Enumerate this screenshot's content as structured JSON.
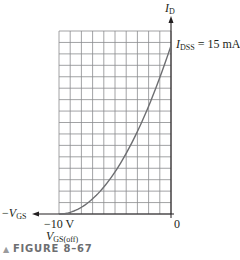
{
  "figure": {
    "caption_marker": "▲",
    "caption": "FIGURE 8–67"
  },
  "labels": {
    "y_axis_var": "I",
    "y_axis_sub": "D",
    "idss_var": "I",
    "idss_sub": "DSS",
    "idss_value": " = 15 mA",
    "x_axis_prefix": "−",
    "x_axis_var": "V",
    "x_axis_sub": "GS",
    "x_min_tick": "−10 V",
    "x_zero_tick": "0",
    "vgs_off_var": "V",
    "vgs_off_sub": "GS(off)"
  },
  "colors": {
    "grid": "#8a8c8e",
    "axis": "#231f20",
    "curve": "#6d6e71",
    "caption": "#6d6e71"
  },
  "chart_data": {
    "type": "line",
    "xlabel": "−V_GS",
    "ylabel": "I_D",
    "xlim": [
      -10,
      0
    ],
    "ylim": [
      0,
      16.3
    ],
    "grid": true,
    "grid_cols": 10,
    "grid_rows": 16,
    "annotations": [
      "I_DSS = 15 mA",
      "−10 V",
      "V_GS(off)",
      "0"
    ],
    "series": [
      {
        "name": "I_D vs V_GS",
        "x": [
          -10,
          -9,
          -8,
          -7,
          -6,
          -5,
          -4,
          -3,
          -2,
          -1,
          0
        ],
        "y": [
          0,
          0.15,
          0.6,
          1.35,
          2.4,
          3.75,
          5.4,
          7.35,
          9.6,
          12.15,
          15
        ]
      }
    ],
    "parameters": {
      "IDSS_mA": 15,
      "VGS_off_V": -10
    }
  }
}
